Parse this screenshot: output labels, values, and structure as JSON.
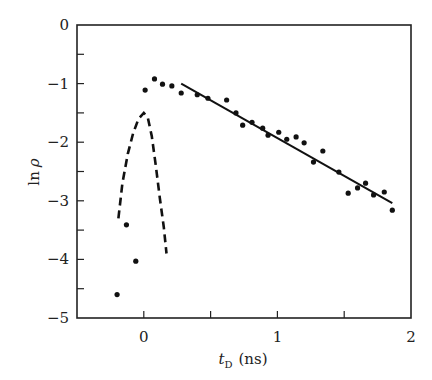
{
  "chart_data": {
    "type": "scatter",
    "title": "",
    "xlabel": "t_D (ns)",
    "xlabel_main": "t",
    "xlabel_sub": "D",
    "xlabel_unit": "(ns)",
    "ylabel": "ln ρ",
    "ylabel_main": "ln",
    "ylabel_sym": "ρ",
    "xlim": [
      -0.5,
      2
    ],
    "ylim": [
      -5,
      0
    ],
    "grid": false,
    "legend": null,
    "x_ticks": [
      0,
      1,
      2
    ],
    "x_tick_labels": [
      "0",
      "1",
      "2"
    ],
    "x_minor_ticks": [
      0.5,
      1.5
    ],
    "y_ticks": [
      0,
      -1,
      -2,
      -3,
      -4,
      -5
    ],
    "y_tick_labels": [
      "0",
      "−1",
      "−2",
      "−3",
      "−4",
      "−5"
    ],
    "y_minor_ticks": [
      -0.5,
      -1.5,
      -2.5,
      -3.5,
      -4.5
    ],
    "series": [
      {
        "name": "measured points",
        "type": "scatter",
        "points": [
          [
            -0.2,
            -4.6
          ],
          [
            -0.13,
            -3.41
          ],
          [
            -0.06,
            -4.03
          ],
          [
            0.01,
            -1.11
          ],
          [
            0.08,
            -0.92
          ],
          [
            0.14,
            -1.01
          ],
          [
            0.21,
            -1.04
          ],
          [
            0.28,
            -1.16
          ],
          [
            0.4,
            -1.19
          ],
          [
            0.48,
            -1.25
          ],
          [
            0.62,
            -1.28
          ],
          [
            0.69,
            -1.5
          ],
          [
            0.74,
            -1.71
          ],
          [
            0.81,
            -1.66
          ],
          [
            0.89,
            -1.76
          ],
          [
            0.93,
            -1.88
          ],
          [
            1.01,
            -1.83
          ],
          [
            1.07,
            -1.95
          ],
          [
            1.14,
            -1.91
          ],
          [
            1.2,
            -2.01
          ],
          [
            1.27,
            -2.34
          ],
          [
            1.34,
            -2.15
          ],
          [
            1.46,
            -2.51
          ],
          [
            1.53,
            -2.87
          ],
          [
            1.6,
            -2.78
          ],
          [
            1.66,
            -2.7
          ],
          [
            1.72,
            -2.9
          ],
          [
            1.8,
            -2.85
          ],
          [
            1.86,
            -3.16
          ]
        ]
      },
      {
        "name": "linear fit",
        "type": "line",
        "style": "solid",
        "points": [
          [
            0.28,
            -1.0
          ],
          [
            1.86,
            -3.04
          ]
        ]
      },
      {
        "name": "pulse profile",
        "type": "line",
        "style": "dashed",
        "points": [
          [
            -0.19,
            -3.3
          ],
          [
            -0.16,
            -2.7
          ],
          [
            -0.12,
            -2.2
          ],
          [
            -0.08,
            -1.85
          ],
          [
            -0.04,
            -1.6
          ],
          [
            0.0,
            -1.5
          ],
          [
            0.03,
            -1.58
          ],
          [
            0.06,
            -1.9
          ],
          [
            0.09,
            -2.4
          ],
          [
            0.12,
            -2.95
          ],
          [
            0.15,
            -3.45
          ],
          [
            0.17,
            -3.9
          ]
        ]
      }
    ]
  }
}
